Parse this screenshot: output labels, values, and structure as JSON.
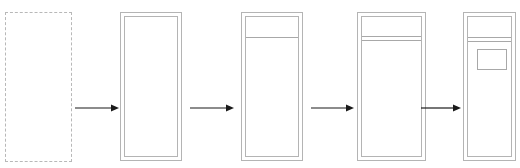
{
  "diagram": {
    "type": "layout-build-sequence",
    "stroke_color": "#b4b4b4",
    "arrow_color": "#1a1a1a",
    "steps": [
      {
        "id": 1,
        "description": "single outline frame"
      },
      {
        "id": 2,
        "description": "double outline frame (outer + inset inner border)"
      },
      {
        "id": 3,
        "description": "double frame with header divider line"
      },
      {
        "id": 4,
        "description": "double frame with double header divider"
      },
      {
        "id": 5,
        "description": "double frame with double header divider and content box"
      }
    ],
    "arrows": [
      {
        "from": 1,
        "to": 2
      },
      {
        "from": 2,
        "to": 3
      },
      {
        "from": 3,
        "to": 4
      },
      {
        "from": 4,
        "to": 5
      }
    ]
  }
}
